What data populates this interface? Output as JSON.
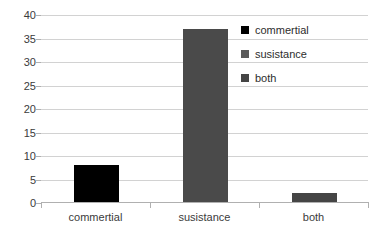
{
  "chart_data": {
    "type": "bar",
    "title": "",
    "xlabel": "",
    "ylabel": "",
    "categories": [
      "commertial",
      "susistance",
      "both"
    ],
    "values": [
      8,
      37,
      2
    ],
    "ylim": [
      0,
      40
    ],
    "ytick_step": 5,
    "yticks": [
      40,
      35,
      30,
      25,
      20,
      15,
      10,
      5,
      0
    ],
    "grid": true,
    "legend_position": "right",
    "series": [
      {
        "name": "commertial",
        "values": [
          8,
          null,
          null
        ],
        "color": "#000000"
      },
      {
        "name": "susistance",
        "values": [
          null,
          37,
          null
        ],
        "color": "#4a4a4a"
      },
      {
        "name": "both",
        "values": [
          null,
          null,
          2
        ],
        "color": "#454545"
      }
    ],
    "bar_colors": [
      "#000000",
      "#4a4a4a",
      "#454545"
    ]
  },
  "legend": {
    "items": [
      {
        "label": "commertial",
        "color": "#000000"
      },
      {
        "label": "susistance",
        "color": "#5a5a5a"
      },
      {
        "label": "both",
        "color": "#454545"
      }
    ]
  },
  "axis": {
    "y_tick_labels": [
      "40",
      "35",
      "30",
      "25",
      "20",
      "15",
      "10",
      "5",
      "0"
    ],
    "x_tick_labels": [
      "commertial",
      "susistance",
      "both"
    ]
  },
  "colors": {
    "gridline": "#d2d2d2",
    "axis": "#b0b0b0",
    "text": "#3b3b3b",
    "background": "#ffffff"
  }
}
